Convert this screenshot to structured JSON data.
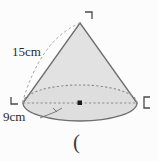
{
  "figure": {
    "type": "cone-geometry-diagram",
    "shape_name": "cone",
    "background_color": "#fcfcfc",
    "body_fill_color": "#e2e2e2",
    "outline_color": "#6f6f6f",
    "dashed_color": "#8a8a8a",
    "text_color": "#2b2b2b",
    "labels": {
      "slant_height": "15cm",
      "base_diameter": "9cm"
    },
    "measurements": {
      "slant_height_value": 15,
      "slant_height_unit": "cm",
      "base_value": 9,
      "base_unit": "cm"
    },
    "markers": {
      "center_point": "center-dot",
      "apex_crop_mark": "⌐",
      "left_crop_mark": "∟",
      "right_crop_mark": "⊏"
    },
    "trailing_text": "("
  }
}
